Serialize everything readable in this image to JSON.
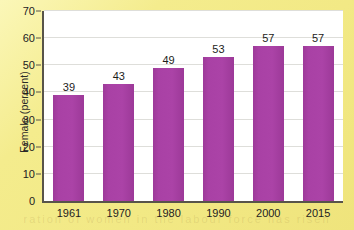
{
  "chart_data": {
    "type": "bar",
    "title": "",
    "subtitle": "",
    "xlabel": "",
    "ylabel": "Female (percent)",
    "categories": [
      "1961",
      "1970",
      "1980",
      "1990",
      "2000",
      "2015"
    ],
    "values": [
      39,
      43,
      49,
      53,
      57,
      57
    ],
    "value_labels": [
      "39",
      "43",
      "49",
      "53",
      "57",
      "57"
    ],
    "ylim": [
      0,
      70
    ],
    "ytick_values": [
      0,
      10,
      20,
      30,
      40,
      50,
      60,
      70
    ],
    "ytick_labels": [
      "0",
      "10",
      "20",
      "30",
      "40",
      "50",
      "60",
      "70"
    ],
    "grid": "horizontal",
    "legend": "none",
    "series": [
      {
        "name": "Female (percent)",
        "values": [
          39,
          43,
          49,
          53,
          57,
          57
        ]
      }
    ],
    "colors": {
      "bar": "#a941a5",
      "page_background": "#f5ee93",
      "plot_background": "#ffffff",
      "axis_line": "#58544a",
      "gridline": "#dededa",
      "text": "#22211f"
    }
  },
  "page": {
    "bleed_text": "ration  of  women  in  the  labour  force  has  risen"
  }
}
